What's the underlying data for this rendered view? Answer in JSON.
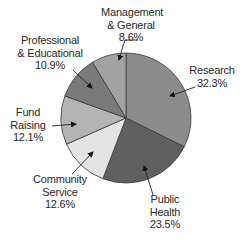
{
  "chart_data": {
    "type": "pie",
    "title": "",
    "start_angle_deg": 0,
    "direction": "clockwise",
    "slices": [
      {
        "label": "Research",
        "lines": [
          "Research",
          "32.3%"
        ],
        "value": 32.3,
        "color": "#8c8c8c"
      },
      {
        "label": "Public Health",
        "lines": [
          "Public",
          "Health",
          "23.5%"
        ],
        "value": 23.5,
        "color": "#606060"
      },
      {
        "label": "Community Service",
        "lines": [
          "Community",
          "Service",
          "12.6%"
        ],
        "value": 12.6,
        "color": "#e4e4e4"
      },
      {
        "label": "Fund Raising",
        "lines": [
          "Fund",
          "Raising",
          "12.1%"
        ],
        "value": 12.1,
        "color": "#b4b4b4"
      },
      {
        "label": "Professional & Educational",
        "lines": [
          "Professional",
          "& Educational",
          "10.9%"
        ],
        "value": 10.9,
        "color": "#7a7a7a"
      },
      {
        "label": "Management & General",
        "lines": [
          "Management",
          "& General",
          "8.6%"
        ],
        "value": 8.6,
        "color": "#a2a2a2"
      }
    ]
  },
  "labels": {
    "research": {
      "l1": "Research",
      "l2": "32.3%"
    },
    "public_health": {
      "l1": "Public",
      "l2": "Health",
      "l3": "23.5%"
    },
    "community_service": {
      "l1": "Community",
      "l2": "Service",
      "l3": "12.6%"
    },
    "fund_raising": {
      "l1": "Fund",
      "l2": "Raising",
      "l3": "12.1%"
    },
    "prof_ed": {
      "l1": "Professional",
      "l2": "& Educational",
      "l3": "10.9%"
    },
    "mgmt": {
      "l1": "Management",
      "l2": "& General",
      "l3": "8.6%"
    }
  }
}
